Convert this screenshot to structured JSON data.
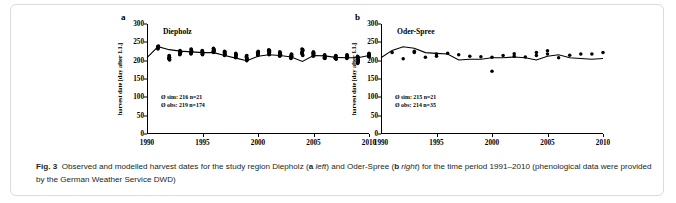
{
  "figure": {
    "label": "Fig. 3",
    "caption_parts": {
      "p1": "Observed and modelled harvest dates for the study region Diepholz (",
      "a": "a",
      "left": "left",
      "p2": ") and Oder-Spree (",
      "b": "b",
      "right": "right",
      "p3": ") for the time period 1991–2010 (phenological data were provided by the German Weather Service DWD)"
    }
  },
  "axes": {
    "y_label": "harvest date [day after 1.1.]",
    "y_ticks": [
      "0",
      "50",
      "100",
      "150",
      "200",
      "250",
      "300"
    ],
    "y_tick_values": [
      0,
      50,
      100,
      150,
      200,
      250,
      300
    ],
    "x_ticks": [
      "1990",
      "1995",
      "2000",
      "2005",
      "2010"
    ],
    "x_tick_values": [
      1990,
      1995,
      2000,
      2005,
      2010
    ],
    "ylim": [
      0,
      300
    ],
    "xlim": [
      1990,
      2010
    ]
  },
  "panel_a": {
    "letter": "a",
    "title": "Diepholz",
    "stat_sim": "Ø sim: 216 n=21",
    "stat_obs": "Ø obs: 219 n=174"
  },
  "panel_b": {
    "letter": "b",
    "title": "Oder-Spree",
    "stat_sim": "Ø sim: 215 n=21",
    "stat_obs": "Ø obs: 214 n=35"
  },
  "colors": {
    "ink": "#000000",
    "caption": "#231f20",
    "frame": "#dcdcdc"
  },
  "chart_data": [
    {
      "type": "line",
      "id": "panel_a",
      "title": "Diepholz",
      "xlabel": "",
      "ylabel": "harvest date [day after 1.1.]",
      "xlim": [
        1990,
        2010
      ],
      "ylim": [
        0,
        300
      ],
      "grid": false,
      "legend": null,
      "annotations": [
        "Ø sim: 216 n=21",
        "Ø obs: 219 n=174"
      ],
      "series": [
        {
          "name": "simulated",
          "style": "line",
          "x": [
            1990,
            1991,
            1992,
            1993,
            1994,
            1995,
            1996,
            1997,
            1998,
            1999,
            2000,
            2001,
            2002,
            2003,
            2004,
            2005,
            2006,
            2007,
            2008,
            2009,
            2010
          ],
          "values": [
            208,
            238,
            230,
            226,
            224,
            222,
            222,
            214,
            207,
            200,
            212,
            216,
            214,
            210,
            198,
            214,
            213,
            209,
            208,
            208,
            214
          ]
        },
        {
          "name": "observed",
          "style": "scatter-cluster",
          "clusters": [
            {
              "x": 1991,
              "ymin": 232,
              "ymax": 240,
              "n": 6
            },
            {
              "x": 1992,
              "ymin": 202,
              "ymax": 214,
              "n": 9
            },
            {
              "x": 1993,
              "ymin": 216,
              "ymax": 228,
              "n": 9
            },
            {
              "x": 1994,
              "ymin": 218,
              "ymax": 232,
              "n": 10
            },
            {
              "x": 1995,
              "ymin": 216,
              "ymax": 228,
              "n": 9
            },
            {
              "x": 1996,
              "ymin": 222,
              "ymax": 234,
              "n": 9
            },
            {
              "x": 1997,
              "ymin": 214,
              "ymax": 226,
              "n": 9
            },
            {
              "x": 1998,
              "ymin": 208,
              "ymax": 220,
              "n": 9
            },
            {
              "x": 1999,
              "ymin": 200,
              "ymax": 214,
              "n": 10
            },
            {
              "x": 2000,
              "ymin": 214,
              "ymax": 226,
              "n": 9
            },
            {
              "x": 2001,
              "ymin": 216,
              "ymax": 230,
              "n": 10
            },
            {
              "x": 2002,
              "ymin": 212,
              "ymax": 224,
              "n": 9
            },
            {
              "x": 2003,
              "ymin": 206,
              "ymax": 218,
              "n": 9
            },
            {
              "x": 2004,
              "ymin": 214,
              "ymax": 232,
              "n": 12
            },
            {
              "x": 2005,
              "ymin": 212,
              "ymax": 224,
              "n": 9
            },
            {
              "x": 2006,
              "ymin": 206,
              "ymax": 216,
              "n": 8
            },
            {
              "x": 2007,
              "ymin": 204,
              "ymax": 214,
              "n": 8
            },
            {
              "x": 2008,
              "ymin": 206,
              "ymax": 216,
              "n": 8
            },
            {
              "x": 2009,
              "ymin": 192,
              "ymax": 212,
              "n": 11
            },
            {
              "x": 2010,
              "ymin": 210,
              "ymax": 220,
              "n": 8
            }
          ]
        }
      ]
    },
    {
      "type": "line",
      "id": "panel_b",
      "title": "Oder-Spree",
      "xlabel": "",
      "ylabel": "harvest date [day after 1.1.]",
      "xlim": [
        1990,
        2010
      ],
      "ylim": [
        0,
        300
      ],
      "grid": false,
      "legend": null,
      "annotations": [
        "Ø sim: 215 n=21",
        "Ø obs: 214 n=35"
      ],
      "series": [
        {
          "name": "simulated",
          "style": "line",
          "x": [
            1990,
            1991,
            1992,
            1993,
            1994,
            1995,
            1996,
            1997,
            1998,
            1999,
            2000,
            2001,
            2002,
            2003,
            2004,
            2005,
            2006,
            2007,
            2008,
            2009,
            2010
          ],
          "values": [
            208,
            228,
            238,
            234,
            222,
            220,
            218,
            202,
            204,
            204,
            208,
            208,
            210,
            208,
            202,
            212,
            216,
            208,
            206,
            204,
            206
          ]
        },
        {
          "name": "observed",
          "style": "scatter",
          "x": [
            1991,
            1992,
            1993,
            1993,
            1994,
            1995,
            1995,
            1996,
            1997,
            1998,
            1999,
            2000,
            2000,
            2001,
            2002,
            2002,
            2003,
            2004,
            2004,
            2005,
            2005,
            2006,
            2007,
            2008,
            2009,
            2010
          ],
          "values": [
            222,
            205,
            226,
            222,
            209,
            218,
            212,
            220,
            216,
            212,
            211,
            209,
            171,
            214,
            219,
            212,
            210,
            222,
            214,
            227,
            218,
            208,
            215,
            218,
            218,
            222
          ]
        }
      ]
    }
  ]
}
